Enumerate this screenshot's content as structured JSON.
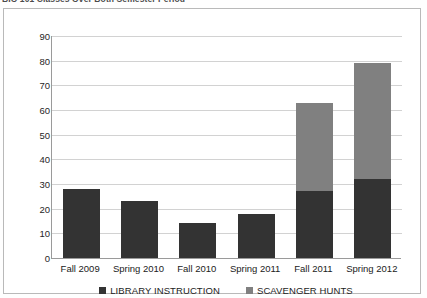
{
  "caption": "BIO 101 Classes Over Both Semester Period",
  "chart_data": {
    "type": "bar",
    "subtype": "stacked-column",
    "title": "BIO 101 Classes Over Both Semester Period",
    "xlabel": "",
    "ylabel": "",
    "ylim": [
      0,
      90
    ],
    "ytick_step": 10,
    "yticks": [
      90,
      80,
      70,
      60,
      50,
      40,
      30,
      20,
      10,
      0
    ],
    "grid": "horizontal",
    "legend_position": "bottom-center",
    "categories": [
      "Fall 2009",
      "Spring 2010",
      "Fall 2010",
      "Spring 2011",
      "Fall 2011",
      "Spring 2012"
    ],
    "series": [
      {
        "name": "LIBRARY INSTRUCTION",
        "color": "#333333",
        "values": [
          28,
          23,
          14,
          18,
          27,
          32
        ]
      },
      {
        "name": "SCAVENGER HUNTS",
        "color": "#808080",
        "values": [
          0,
          0,
          0,
          0,
          36,
          47
        ]
      }
    ],
    "totals": [
      28,
      23,
      14,
      18,
      63,
      79
    ]
  },
  "colors": {
    "library_instruction": "#333333",
    "scavenger_hunts": "#808080",
    "gridline": "#d2d2d2",
    "axis": "#9a9a9a",
    "frame": "#b9b9b9"
  }
}
